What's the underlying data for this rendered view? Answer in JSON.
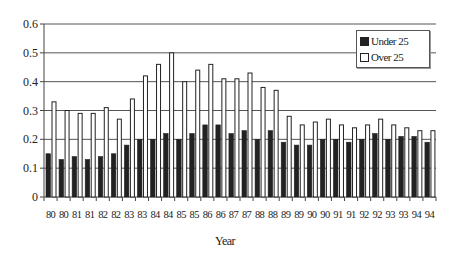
{
  "chart_data": {
    "type": "bar",
    "title": "",
    "xlabel": "Year",
    "ylabel": "",
    "ylim": [
      0,
      0.6
    ],
    "yticks": [
      "0",
      "0.1",
      "0.2",
      "0.3",
      "0.4",
      "0.5",
      "0.6"
    ],
    "grid": true,
    "legend_position": "top-right",
    "categories": [
      "80",
      "80",
      "81",
      "81",
      "82",
      "82",
      "83",
      "83",
      "84",
      "84",
      "85",
      "85",
      "86",
      "86",
      "87",
      "87",
      "88",
      "88",
      "89",
      "89",
      "90",
      "90",
      "91",
      "91",
      "92",
      "92",
      "93",
      "93",
      "94",
      "94"
    ],
    "series": [
      {
        "name": "Under 25",
        "color": "#222222",
        "values": [
          0.15,
          0.13,
          0.14,
          0.13,
          0.14,
          0.15,
          0.18,
          0.2,
          0.2,
          0.22,
          0.2,
          0.22,
          0.25,
          0.25,
          0.22,
          0.23,
          0.2,
          0.23,
          0.19,
          0.18,
          0.18,
          0.2,
          0.2,
          0.19,
          0.2,
          0.22,
          0.2,
          0.21,
          0.21,
          0.19
        ]
      },
      {
        "name": "Over 25",
        "color": "#ffffff",
        "values": [
          0.33,
          0.3,
          0.29,
          0.29,
          0.31,
          0.27,
          0.34,
          0.42,
          0.46,
          0.5,
          0.4,
          0.44,
          0.46,
          0.41,
          0.41,
          0.43,
          0.38,
          0.37,
          0.28,
          0.25,
          0.26,
          0.27,
          0.25,
          0.24,
          0.25,
          0.27,
          0.25,
          0.24,
          0.23,
          0.23
        ]
      }
    ]
  }
}
